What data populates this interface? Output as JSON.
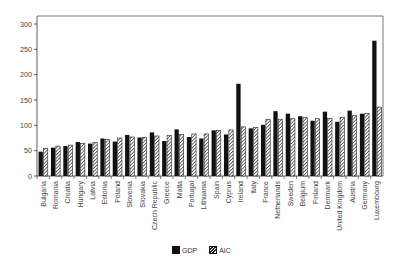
{
  "chart_data": {
    "type": "bar",
    "title": "",
    "xlabel": "",
    "ylabel": "",
    "ylim": [
      0,
      300
    ],
    "yticks": [
      0,
      50,
      100,
      150,
      200,
      250,
      300
    ],
    "grid": false,
    "legend_position": "bottom",
    "categories": [
      "Bulgaria",
      "Romania",
      "Croatia",
      "Hungary",
      "Latvia",
      "Estonia",
      "Poland",
      "Slovenia",
      "Slovakia",
      "Czech Republic",
      "Greece",
      "Malta",
      "Portugal",
      "Lithuania",
      "Spain",
      "Cyprus",
      "Ireland",
      "Italy",
      "France",
      "Netherlands",
      "Sweden",
      "Belgium",
      "Finland",
      "Denmark",
      "United Kingdom",
      "Austria",
      "Germany",
      "Luxembourg"
    ],
    "series": [
      {
        "name": "GDP",
        "color": "#111111",
        "pattern": "solid",
        "values": [
          48,
          56,
          59,
          67,
          64,
          74,
          68,
          81,
          76,
          86,
          69,
          92,
          77,
          74,
          90,
          82,
          182,
          94,
          101,
          128,
          123,
          118,
          109,
          127,
          107,
          129,
          123,
          267
        ]
      },
      {
        "name": "AIC",
        "color": "#ffffff",
        "pattern": "hatched",
        "values": [
          54,
          59,
          61,
          64,
          66,
          72,
          75,
          77,
          76,
          79,
          80,
          82,
          83,
          83,
          90,
          91,
          97,
          96,
          112,
          112,
          113,
          115,
          113,
          114,
          116,
          119,
          123,
          136
        ]
      }
    ]
  },
  "legend": {
    "gdp_label": "GDP",
    "aic_label": "AIC"
  }
}
